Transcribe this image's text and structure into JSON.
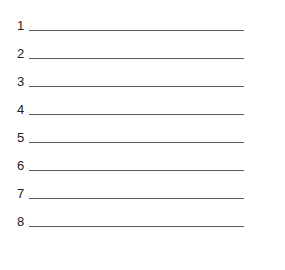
{
  "worksheet": {
    "lines": [
      {
        "number": "1",
        "value": ""
      },
      {
        "number": "2",
        "value": ""
      },
      {
        "number": "3",
        "value": ""
      },
      {
        "number": "4",
        "value": ""
      },
      {
        "number": "5",
        "value": ""
      },
      {
        "number": "6",
        "value": ""
      },
      {
        "number": "7",
        "value": ""
      },
      {
        "number": "8",
        "value": ""
      }
    ]
  }
}
